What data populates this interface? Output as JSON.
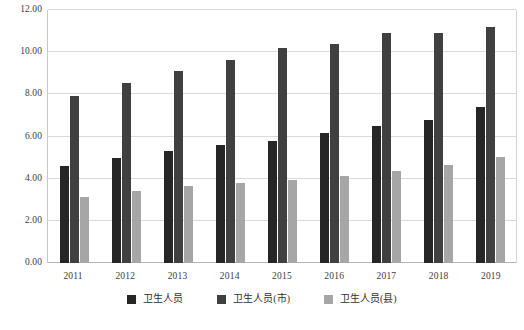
{
  "chart_data": {
    "type": "bar",
    "title": "",
    "xlabel": "",
    "ylabel": "",
    "ylim": [
      0,
      12
    ],
    "yticks": [
      "0.00",
      "2.00",
      "4.00",
      "6.00",
      "8.00",
      "10.00",
      "12.00"
    ],
    "ytick_values": [
      0,
      2,
      4,
      6,
      8,
      10,
      12
    ],
    "grid": true,
    "legend_position": "bottom",
    "categories": [
      "2011",
      "2012",
      "2013",
      "2014",
      "2015",
      "2016",
      "2017",
      "2018",
      "2019"
    ],
    "series": [
      {
        "name": "卫生人员",
        "color": "#262626",
        "values": [
          4.6,
          5.0,
          5.3,
          5.6,
          5.8,
          6.15,
          6.5,
          6.8,
          7.4
        ]
      },
      {
        "name": "卫生人员(市)",
        "color": "#404040",
        "values": [
          7.9,
          8.55,
          9.1,
          9.65,
          10.2,
          10.4,
          10.9,
          10.9,
          11.2
        ]
      },
      {
        "name": "卫生人员(县)",
        "color": "#a6a6a6",
        "values": [
          3.15,
          3.4,
          3.65,
          3.8,
          3.95,
          4.15,
          4.35,
          4.65,
          5.05
        ]
      }
    ]
  },
  "caption": "",
  "colors": {
    "gridline": "#d9d9d9",
    "axis": "#b5b5b5",
    "text": "#3d3d3d",
    "background": "#ffffff"
  }
}
